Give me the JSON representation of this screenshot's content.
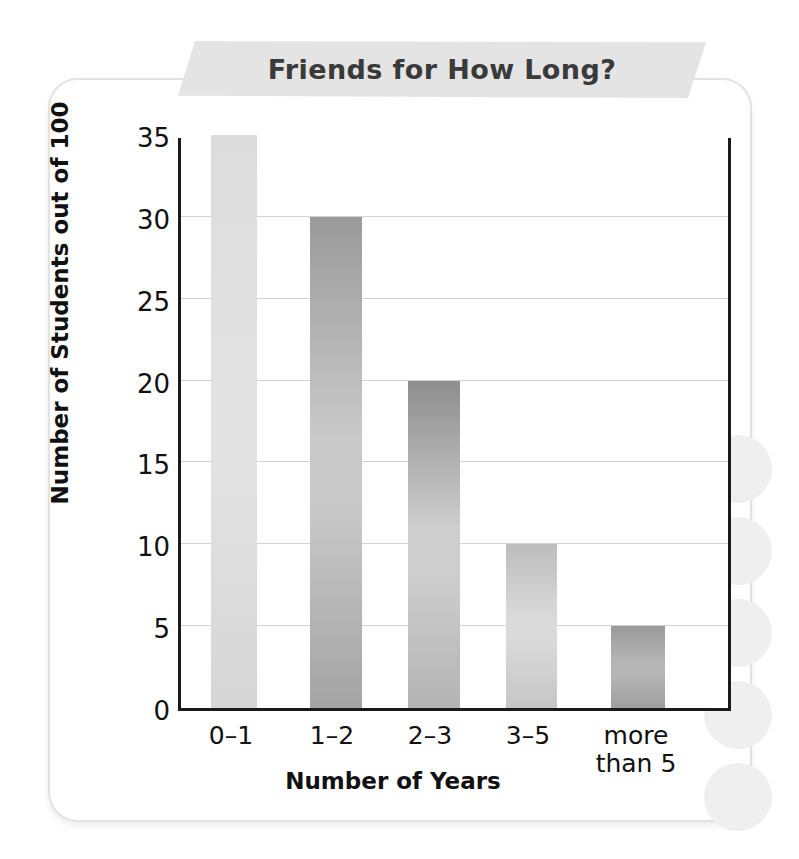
{
  "page": {
    "background_color": "#ffffff",
    "card_border_color": "#e2e2e2"
  },
  "banner": {
    "title": "Friends for How Long?",
    "background_color": "#e4e4e4",
    "text_color": "#3a3a3a"
  },
  "chart_data": {
    "type": "bar",
    "title": "Friends for How Long?",
    "categories": [
      "0–1",
      "1–2",
      "2–3",
      "3–5",
      "more than 5"
    ],
    "category_lines": [
      [
        "0–1"
      ],
      [
        "1–2"
      ],
      [
        "2–3"
      ],
      [
        "3–5"
      ],
      [
        "more",
        "than 5"
      ]
    ],
    "values": [
      35,
      30,
      20,
      10,
      5
    ],
    "xlabel": "Number of Years",
    "ylabel": "Number of Students out of 100",
    "ylim": [
      0,
      35
    ],
    "ytick_values": [
      0,
      5,
      10,
      15,
      20,
      25,
      30,
      35
    ],
    "ytick_labels": [
      "0",
      "5",
      "10",
      "15",
      "20",
      "25",
      "30",
      "35"
    ],
    "ytick_step": 5,
    "grid": true,
    "grid_color": "#d2d2d2",
    "legend": null,
    "axis_color": "#1a1a1a",
    "bar_styles": [
      {
        "category": "0–1",
        "value": 35,
        "top_color": "#dcdcdc",
        "mid_color": "#e2e2e2",
        "bottom_color": "#d6d6d6"
      },
      {
        "category": "1–2",
        "value": 30,
        "top_color": "#9b9b9b",
        "mid_color": "#c9c9c9",
        "bottom_color": "#a4a4a4"
      },
      {
        "category": "2–3",
        "value": 20,
        "top_color": "#8e8e8e",
        "mid_color": "#cecece",
        "bottom_color": "#b4b4b4"
      },
      {
        "category": "3–5",
        "value": 10,
        "top_color": "#bdbdbd",
        "mid_color": "#dadada",
        "bottom_color": "#c6c6c6"
      },
      {
        "category": "more than 5",
        "value": 5,
        "top_color": "#9a9a9a",
        "mid_color": "#b6b6b6",
        "bottom_color": "#9f9f9f"
      }
    ],
    "bar_geometry": [
      {
        "left": 208,
        "width": 46
      },
      {
        "left": 307,
        "width": 52
      },
      {
        "left": 405,
        "width": 52
      },
      {
        "left": 503,
        "width": 51
      },
      {
        "left": 608,
        "width": 54
      }
    ],
    "label_geometry": [
      {
        "left": 185,
        "width": 92
      },
      {
        "left": 284,
        "width": 96
      },
      {
        "left": 382,
        "width": 96
      },
      {
        "left": 480,
        "width": 96
      },
      {
        "left": 586,
        "width": 100
      }
    ]
  }
}
